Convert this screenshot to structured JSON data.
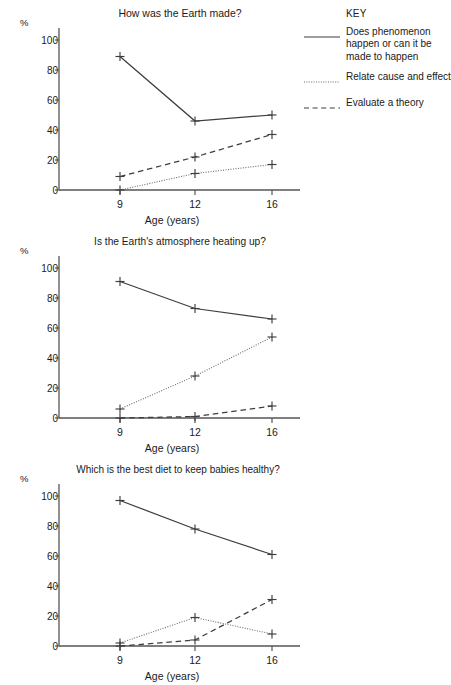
{
  "legend": {
    "title": "KEY",
    "items": [
      {
        "style": "solid",
        "label": "Does phenomenon happen or can it be made to happen"
      },
      {
        "style": "dotted",
        "label": "Relate cause and effect"
      },
      {
        "style": "dashed",
        "label": "Evaluate a theory"
      }
    ]
  },
  "axis": {
    "y_unit": "%",
    "x_title": "Age (years)",
    "y_ticks": [
      "0",
      "20",
      "40",
      "60",
      "80",
      "100"
    ],
    "x_ticks": [
      "9",
      "12",
      "16"
    ]
  },
  "chart_data": [
    {
      "type": "line",
      "title": "How was the Earth made?",
      "xlabel": "Age (years)",
      "ylabel": "%",
      "x": [
        9,
        12,
        16
      ],
      "xticklabels": [
        "9",
        "12",
        "16"
      ],
      "ylim": [
        0,
        100
      ],
      "yticks": [
        0,
        20,
        40,
        60,
        80,
        100
      ],
      "grid": false,
      "legend_position": "right",
      "marker": "+",
      "series": [
        {
          "name": "Does phenomenon happen or can it be made to happen",
          "style": "solid",
          "values": [
            89,
            46,
            50
          ]
        },
        {
          "name": "Relate cause and effect",
          "style": "dotted",
          "values": [
            0,
            11,
            17
          ]
        },
        {
          "name": "Evaluate a theory",
          "style": "dashed",
          "values": [
            9,
            22,
            37
          ]
        }
      ]
    },
    {
      "type": "line",
      "title": "Is the Earth's atmosphere heating up?",
      "xlabel": "Age (years)",
      "ylabel": "%",
      "x": [
        9,
        12,
        16
      ],
      "xticklabels": [
        "9",
        "12",
        "16"
      ],
      "ylim": [
        0,
        100
      ],
      "yticks": [
        0,
        20,
        40,
        60,
        80,
        100
      ],
      "grid": false,
      "legend_position": "right",
      "marker": "+",
      "series": [
        {
          "name": "Does phenomenon happen or can it be made to happen",
          "style": "solid",
          "values": [
            91,
            73,
            66
          ]
        },
        {
          "name": "Relate cause and effect",
          "style": "dotted",
          "values": [
            6,
            28,
            54
          ]
        },
        {
          "name": "Evaluate a theory",
          "style": "dashed",
          "values": [
            0,
            1,
            8
          ]
        }
      ]
    },
    {
      "type": "line",
      "title": "Which is the best diet to keep babies healthy?",
      "xlabel": "Age (years)",
      "ylabel": "%",
      "x": [
        9,
        12,
        16
      ],
      "xticklabels": [
        "9",
        "12",
        "16"
      ],
      "ylim": [
        0,
        100
      ],
      "yticks": [
        0,
        20,
        40,
        60,
        80,
        100
      ],
      "grid": false,
      "legend_position": "right",
      "marker": "+",
      "series": [
        {
          "name": "Does phenomenon happen or can it be made to happen",
          "style": "solid",
          "values": [
            97,
            78,
            61
          ]
        },
        {
          "name": "Relate cause and effect",
          "style": "dotted",
          "values": [
            2,
            19,
            8
          ]
        },
        {
          "name": "Evaluate a theory",
          "style": "dashed",
          "values": [
            0,
            4,
            31
          ]
        }
      ]
    }
  ],
  "colors": {
    "line": "#3d3d3d",
    "axis": "#555555",
    "text": "#1a1a1a",
    "background": "#ffffff"
  }
}
